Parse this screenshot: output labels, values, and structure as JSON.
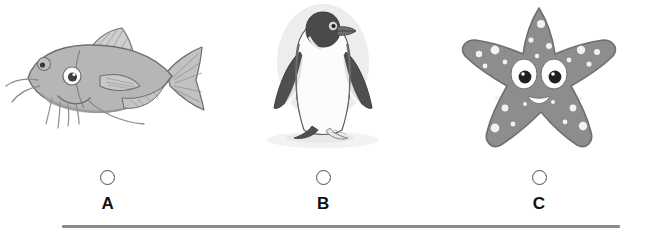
{
  "question": {
    "type": "multiple-choice-image",
    "selected": null,
    "divider_color": "#8a8a8a",
    "background_color": "#ffffff",
    "options": [
      {
        "letter": "A",
        "icon": "catfish-illustration",
        "subject": "catfish",
        "colors": {
          "body": "#b4b4b4",
          "body_shade": "#9a9a9a",
          "outline": "#6e6e6e",
          "fin": "#c8c8c8",
          "eye_white": "#ffffff",
          "eye_pupil": "#3a3a3a"
        }
      },
      {
        "letter": "B",
        "icon": "penguin-illustration",
        "subject": "penguin",
        "colors": {
          "body_dark": "#4f4f4f",
          "body_light": "#fbfbfb",
          "outline": "#5a5a5a",
          "halo": "#ededed",
          "beak": "#6b6b6b",
          "eye": "#2b2b2b",
          "shadow": "#f0f0f0"
        }
      },
      {
        "letter": "C",
        "icon": "starfish-illustration",
        "subject": "starfish",
        "colors": {
          "body": "#8d8d8d",
          "outline": "#6f6f6f",
          "spots": "#f2f2f2",
          "eye_white": "#ffffff",
          "eye_pupil": "#1f1f1f",
          "mouth": "#ffffff"
        }
      }
    ]
  }
}
